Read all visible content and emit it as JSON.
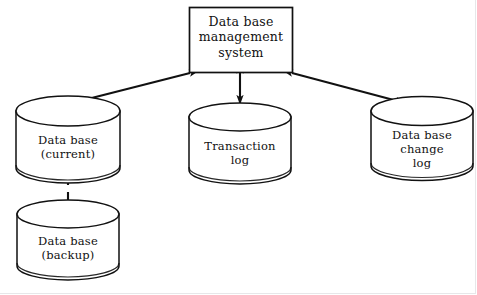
{
  "diagram": {
    "type": "block-diagram",
    "background_color": "#ffffff",
    "stroke_color": "#111111",
    "frame_color": "#e7e7e9",
    "nodes": [
      {
        "id": "dbms",
        "shape": "rectangle",
        "label": "Data base\nmanagement\nsystem",
        "line1": "Data base",
        "line2": "management",
        "line3": "system"
      },
      {
        "id": "db-current",
        "shape": "cylinder",
        "label": "Data base\n(current)",
        "line1": "Data base",
        "line2": "(current)"
      },
      {
        "id": "transaction-log",
        "shape": "cylinder",
        "label": "Transaction\nlog",
        "line1": "Transaction",
        "line2": "log"
      },
      {
        "id": "db-change-log",
        "shape": "cylinder",
        "label": "Data base\nchange\nlog",
        "line1": "Data base",
        "line2": "change",
        "line3": "log"
      },
      {
        "id": "db-backup",
        "shape": "cylinder",
        "label": "Data base\n(backup)",
        "line1": "Data base",
        "line2": "(backup)"
      }
    ],
    "connectors": [
      {
        "id": "dbms-to-db-current",
        "from": "dbms",
        "to": "db-current",
        "style": "solid",
        "arrowheads": "both"
      },
      {
        "id": "dbms-to-transaction-log",
        "from": "dbms",
        "to": "transaction-log",
        "style": "solid",
        "arrowheads": "both"
      },
      {
        "id": "dbms-to-db-change-log",
        "from": "dbms",
        "to": "db-change-log",
        "style": "solid",
        "arrowheads": "both"
      },
      {
        "id": "db-current-to-db-backup",
        "from": "db-current",
        "to": "db-backup",
        "style": "dashed",
        "arrowheads": "none"
      }
    ]
  }
}
